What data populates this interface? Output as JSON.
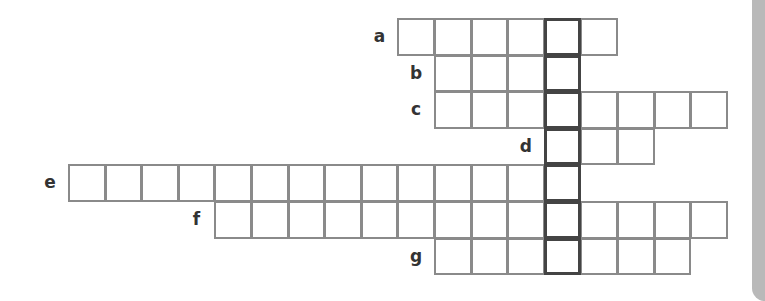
{
  "puzzle": {
    "type": "crossword",
    "cell_size": 36.6,
    "origin_x": 68,
    "origin_y": 18,
    "key_column": 13,
    "colors": {
      "border": "#8a8a8a",
      "key_border": "#444444",
      "side_tab": "#b9b9b9",
      "label": "#333333"
    },
    "rows": [
      {
        "label": "a",
        "row": 0,
        "start_col": 9,
        "length": 6
      },
      {
        "label": "b",
        "row": 1,
        "start_col": 10,
        "length": 4
      },
      {
        "label": "c",
        "row": 2,
        "start_col": 10,
        "length": 8
      },
      {
        "label": "d",
        "row": 3,
        "start_col": 13,
        "length": 3
      },
      {
        "label": "e",
        "row": 4,
        "start_col": 0,
        "length": 14
      },
      {
        "label": "f",
        "row": 5,
        "start_col": 4,
        "length": 14
      },
      {
        "label": "g",
        "row": 6,
        "start_col": 10,
        "length": 7
      }
    ]
  }
}
